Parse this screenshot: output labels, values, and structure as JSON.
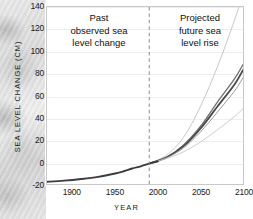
{
  "chart_data": {
    "type": "line",
    "title": "",
    "xlabel": "YEAR",
    "ylabel": "SEA LEVEL CHANGE (CM)",
    "xlim": [
      1870,
      2100
    ],
    "ylim": [
      -20,
      140
    ],
    "xticks": [
      1900,
      1950,
      2000,
      2050,
      2100
    ],
    "yticks": [
      -20,
      0,
      20,
      40,
      60,
      80,
      100,
      120,
      140
    ],
    "grid": true,
    "legend_position": "none",
    "annotations": [
      {
        "name": "past-observed",
        "lines": [
          "Past",
          "observed sea",
          "level change"
        ],
        "x_region": [
          1870,
          1990
        ]
      },
      {
        "name": "projected-future",
        "lines": [
          "Projected",
          "future sea",
          "level rise"
        ],
        "x_region": [
          1990,
          2100
        ]
      }
    ],
    "divider": {
      "x": 1990,
      "style": "dashed",
      "color": "#8a8a8a"
    },
    "series": [
      {
        "name": "Observed sea level change",
        "kind": "historical",
        "color": "#3c3c3c",
        "width": 1.9,
        "dash": "solid",
        "x": [
          1870,
          1890,
          1910,
          1930,
          1950,
          1960,
          1970,
          1980,
          1990,
          2000
        ],
        "values": [
          -18,
          -17,
          -15.5,
          -13.5,
          -10.5,
          -8.5,
          -6,
          -4,
          -1.5,
          0.5
        ]
      },
      {
        "name": "Projection - highest scenario",
        "kind": "projection",
        "color": "#b8b8b8",
        "width": 0.8,
        "dash": "solid",
        "x": [
          1990,
          2010,
          2030,
          2050,
          2070,
          2090,
          2100
        ],
        "values": [
          -1.5,
          6,
          22,
          50,
          86,
          128,
          152
        ]
      },
      {
        "name": "Projection - upper-mid scenario",
        "kind": "projection",
        "color": "#6e6e6e",
        "width": 1.3,
        "dash": "solid",
        "x": [
          1990,
          2010,
          2030,
          2050,
          2070,
          2090,
          2100
        ],
        "values": [
          -1.5,
          4,
          15,
          32,
          54,
          75,
          88
        ]
      },
      {
        "name": "Projection - central scenario",
        "kind": "projection",
        "color": "#4a4a4a",
        "width": 1.8,
        "dash": "solid",
        "x": [
          1990,
          2010,
          2030,
          2050,
          2070,
          2090,
          2100
        ],
        "values": [
          -1.5,
          4,
          14,
          30,
          50,
          70,
          83
        ]
      },
      {
        "name": "Projection - lower-mid scenario",
        "kind": "projection",
        "color": "#9a9a9a",
        "width": 1.0,
        "dash": "solid",
        "x": [
          1990,
          2010,
          2030,
          2050,
          2070,
          2090,
          2100
        ],
        "values": [
          -1.5,
          3.5,
          12.5,
          27,
          45,
          64,
          76
        ]
      },
      {
        "name": "Projection - lowest scenario",
        "kind": "projection",
        "color": "#bfbfbf",
        "width": 0.8,
        "dash": "solid",
        "x": [
          1990,
          2010,
          2030,
          2050,
          2070,
          2090,
          2100
        ],
        "values": [
          -1.5,
          3,
          9,
          18,
          29,
          41,
          48
        ]
      }
    ]
  },
  "axes": {
    "xlabel": "YEAR",
    "ylabel": "SEA LEVEL CHANGE (CM)"
  }
}
